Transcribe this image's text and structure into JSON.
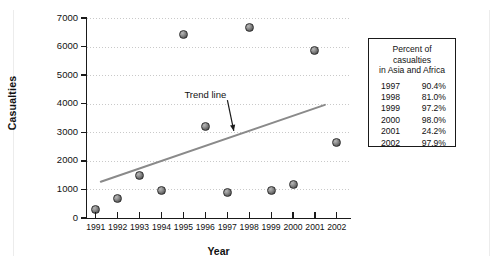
{
  "chart_data": {
    "type": "scatter",
    "title": "",
    "xlabel": "Year",
    "ylabel": "Casualties",
    "x": [
      1991,
      1992,
      1993,
      1994,
      1995,
      1996,
      1997,
      1998,
      1999,
      2000,
      2001,
      2002
    ],
    "categories": [
      "1991",
      "1992",
      "1993",
      "1994",
      "1995",
      "1996",
      "1997",
      "1998",
      "1999",
      "2000",
      "2001",
      "2002"
    ],
    "values": [
      300,
      700,
      1480,
      980,
      6430,
      3220,
      890,
      6680,
      980,
      1160,
      5870,
      2650
    ],
    "series": [
      {
        "name": "Casualties",
        "values": [
          300,
          700,
          1480,
          980,
          6430,
          3220,
          890,
          6680,
          980,
          1160,
          5870,
          2650
        ]
      },
      {
        "name": "Trend line",
        "type": "line",
        "x": [
          1991.0,
          1002.5,
          2002.0
        ],
        "endpoints": [
          [
            1991.0,
            1270
          ],
          [
            2002.0,
            3960
          ]
        ]
      }
    ],
    "ylim": [
      0,
      7000
    ],
    "xlim": [
      1990.6,
      2002.6
    ],
    "yticks": [
      0,
      1000,
      2000,
      3000,
      4000,
      5000,
      6000,
      7000
    ],
    "ytick_labels": [
      "0",
      "1000",
      "2000",
      "3000",
      "4000",
      "5000",
      "6000",
      "7000"
    ],
    "grid": true,
    "grid_axis": "y",
    "legend": "none",
    "annotations": [
      {
        "text": "Trend line",
        "x": 1996.0,
        "y": 4300,
        "arrow_to": [
          1997.3,
          3050
        ]
      }
    ],
    "marker_color": "#6b6b6b",
    "trendline_color": "#8a8a8a",
    "axis_color": "#1a1a1a"
  },
  "axes": {
    "y_label": "Casualties",
    "x_label": "Year",
    "y_ticks": [
      "7000",
      "6000",
      "5000",
      "4000",
      "3000",
      "2000",
      "1000",
      "0"
    ],
    "x_ticks": [
      "1991",
      "1992",
      "1993",
      "1994",
      "1995",
      "1996",
      "1997",
      "1998",
      "1999",
      "2000",
      "2001",
      "2002"
    ]
  },
  "annotation": {
    "trend_label": "Trend line"
  },
  "legend_box": {
    "title_line1": "Percent of casualties",
    "title_line2": "in Asia and Africa",
    "rows": [
      {
        "year": "1997",
        "percent": "90.4%"
      },
      {
        "year": "1998",
        "percent": "81.0%"
      },
      {
        "year": "1999",
        "percent": "97.2%"
      },
      {
        "year": "2000",
        "percent": "98.0%"
      },
      {
        "year": "2001",
        "percent": "24.2%"
      },
      {
        "year": "2002",
        "percent": "97.9%"
      }
    ]
  }
}
